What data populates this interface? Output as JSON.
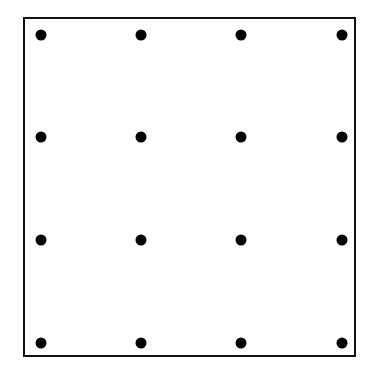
{
  "diagram": {
    "type": "dot-grid",
    "rows": 4,
    "cols": 4,
    "border_color": "#111111",
    "dot_color": "#000000",
    "col_x": [
      41,
      141,
      241,
      342
    ],
    "row_y": [
      35,
      137,
      240,
      343
    ]
  }
}
